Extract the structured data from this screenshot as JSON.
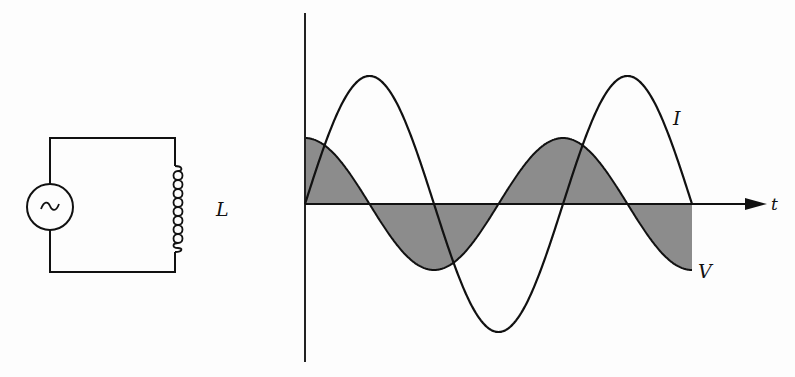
{
  "figure": {
    "circuit": {
      "source_symbol": "~",
      "inductor_label": "L"
    },
    "plot": {
      "time_axis_label": "t",
      "current_label": "I",
      "voltage_label": "V"
    }
  },
  "colors": {
    "ink": "#111111",
    "shade": "#8c8c8c",
    "background": "#fdfdfd"
  },
  "chart_data": {
    "type": "line",
    "title": "",
    "xlabel": "t",
    "ylabel": "",
    "grid": false,
    "series": [
      {
        "name": "I",
        "form": "sin(ωt)",
        "relative_amplitude": 2.0,
        "start_phase_deg": 0,
        "periods_shown": 1.75
      },
      {
        "name": "V",
        "form": "cos(ωt)",
        "relative_amplitude": 1.0,
        "start_phase_deg": 90,
        "periods_shown": 1.5,
        "shaded_to_axis": true
      }
    ]
  }
}
